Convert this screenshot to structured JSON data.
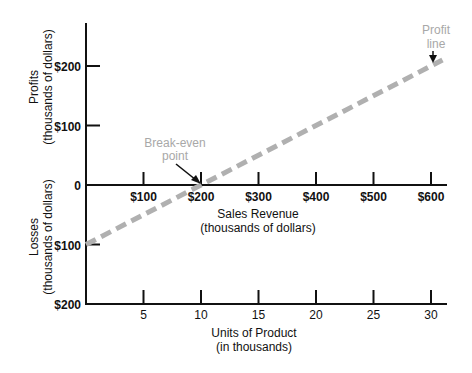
{
  "chart_data": {
    "type": "line",
    "title": "",
    "x_axis_top": {
      "label": "Sales Revenue",
      "sublabel": "(thousands of dollars)",
      "ticks": [
        "$100",
        "$200",
        "$300",
        "$400",
        "$500",
        "$600"
      ],
      "values": [
        100,
        200,
        300,
        400,
        500,
        600
      ]
    },
    "x_axis_bottom": {
      "label": "Units of Product",
      "sublabel": "(in thousands)",
      "ticks": [
        "5",
        "10",
        "15",
        "20",
        "25",
        "30"
      ],
      "values": [
        5,
        10,
        15,
        20,
        25,
        30
      ]
    },
    "y_axis_profits": {
      "label": "Profits",
      "sublabel": "(thousands of dollars)",
      "ticks": [
        "$200",
        "$100",
        "0"
      ],
      "values": [
        200,
        100,
        0
      ]
    },
    "y_axis_losses": {
      "label": "Losses",
      "sublabel": "(thousands of dollars)",
      "ticks": [
        "$100",
        "$200"
      ],
      "values": [
        -100,
        -200
      ]
    },
    "ylim": [
      -200,
      250
    ],
    "xlim": [
      0,
      620
    ],
    "series": [
      {
        "name": "Profit line",
        "style": "dashed",
        "color": "#b0b0b0",
        "x_sales_revenue": [
          0,
          200,
          620
        ],
        "x_units": [
          0,
          10,
          31
        ],
        "y_profit": [
          -100,
          0,
          210
        ]
      }
    ],
    "annotations": [
      {
        "text_lines": [
          "Break-even",
          "point"
        ],
        "points_to": {
          "sales_revenue": 200,
          "profit": 0
        },
        "color": "#a8a8a8"
      },
      {
        "text_lines": [
          "Profit",
          "line"
        ],
        "points_to": {
          "sales_revenue": 600,
          "profit": 205
        },
        "color": "#a8a8a8"
      }
    ],
    "grid": false,
    "legend": "none"
  }
}
